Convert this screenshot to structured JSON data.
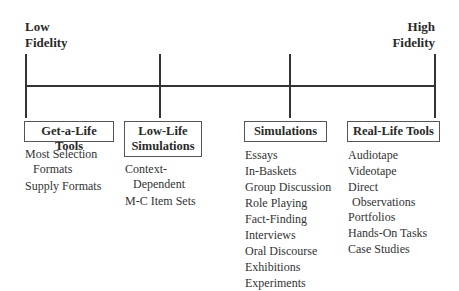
{
  "diagram": {
    "type": "fidelity-continuum",
    "left_end": {
      "line1": "Low",
      "line2": "Fidelity"
    },
    "right_end": {
      "line1": "High",
      "line2": "Fidelity"
    },
    "categories": [
      {
        "title_line1": "Get-a-Life Tools",
        "title_line2": "",
        "items": [
          {
            "line1": "Most Selection",
            "line2": "Formats"
          },
          {
            "line1": "Supply Formats",
            "line2": ""
          }
        ]
      },
      {
        "title_line1": "Low-Life",
        "title_line2": "Simulations",
        "items": [
          {
            "line1": "Context-",
            "line2": "Dependent"
          },
          {
            "line1": "M-C Item Sets",
            "line2": ""
          }
        ]
      },
      {
        "title_line1": "Simulations",
        "title_line2": "",
        "items": [
          {
            "line1": "Essays",
            "line2": ""
          },
          {
            "line1": "In-Baskets",
            "line2": ""
          },
          {
            "line1": "Group Discussion",
            "line2": ""
          },
          {
            "line1": "Role Playing",
            "line2": ""
          },
          {
            "line1": "Fact-Finding",
            "line2": ""
          },
          {
            "line1": "Interviews",
            "line2": ""
          },
          {
            "line1": "Oral Discourse",
            "line2": ""
          },
          {
            "line1": "Exhibitions",
            "line2": ""
          },
          {
            "line1": "Experiments",
            "line2": ""
          }
        ]
      },
      {
        "title_line1": "Real-Life Tools",
        "title_line2": "",
        "items": [
          {
            "line1": "Audiotape",
            "line2": ""
          },
          {
            "line1": "Videotape",
            "line2": ""
          },
          {
            "line1": "Direct",
            "line2": "Observations"
          },
          {
            "line1": "Portfolios",
            "line2": ""
          },
          {
            "line1": "Hands-On Tasks",
            "line2": ""
          },
          {
            "line1": "Case Studies",
            "line2": ""
          }
        ]
      }
    ]
  }
}
